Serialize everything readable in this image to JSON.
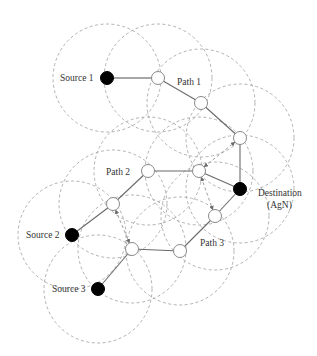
{
  "diagram": {
    "type": "multi-path wireless routing",
    "labels": {
      "source1": "Source 1",
      "source2": "Source 2",
      "source3": "Source 3",
      "path1": "Path 1",
      "path2": "Path 2",
      "path3": "Path 3",
      "destination_line1": "Destination",
      "destination_line2": "(AgN)"
    },
    "colors": {
      "endpoint_fill": "#000000",
      "relay_fill": "#ffffff",
      "link": "#6a6a6a",
      "range_circle": "#a8a8a8"
    },
    "nodes": [
      {
        "id": "source1",
        "kind": "source",
        "x": 107,
        "y": 78
      },
      {
        "id": "p1a",
        "kind": "relay",
        "x": 158,
        "y": 78
      },
      {
        "id": "p1b",
        "kind": "relay",
        "x": 201,
        "y": 103
      },
      {
        "id": "p1c",
        "kind": "relay",
        "x": 240,
        "y": 138
      },
      {
        "id": "destination",
        "kind": "destination",
        "x": 240,
        "y": 189
      },
      {
        "id": "p2d",
        "kind": "relay",
        "x": 199,
        "y": 171
      },
      {
        "id": "p2e",
        "kind": "relay",
        "x": 148,
        "y": 171
      },
      {
        "id": "p2f",
        "kind": "relay",
        "x": 113,
        "y": 204
      },
      {
        "id": "source2",
        "kind": "source",
        "x": 72,
        "y": 235
      },
      {
        "id": "p3g",
        "kind": "relay",
        "x": 132,
        "y": 249
      },
      {
        "id": "p3h",
        "kind": "relay",
        "x": 180,
        "y": 251
      },
      {
        "id": "p3i",
        "kind": "relay",
        "x": 215,
        "y": 216
      },
      {
        "id": "source3",
        "kind": "source",
        "x": 98,
        "y": 289
      }
    ],
    "paths": [
      {
        "name": "Path 1",
        "nodes": [
          "source1",
          "p1a",
          "p1b",
          "p1c",
          "destination"
        ]
      },
      {
        "name": "Path 2",
        "nodes": [
          "source2",
          "p2f",
          "p2e",
          "p2d",
          "destination"
        ]
      },
      {
        "name": "Path 3",
        "nodes": [
          "source3",
          "p3g",
          "p3h",
          "p3i",
          "destination"
        ]
      }
    ],
    "overhearing_links": [
      [
        "p2d",
        "p1c"
      ],
      [
        "p2d",
        "p3i"
      ],
      [
        "p2f",
        "p3g"
      ]
    ],
    "range_radius": 54
  }
}
